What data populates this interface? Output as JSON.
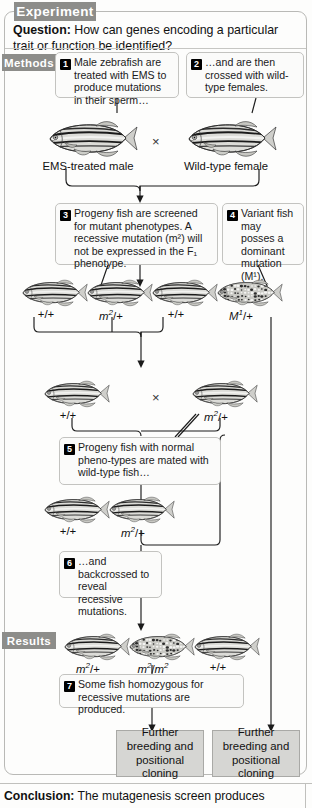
{
  "figure": {
    "section_experiment": "Experiment",
    "section_methods": "Methods",
    "section_results": "Results",
    "question_label": "Question:",
    "question_text": "How can genes encoding a particular trait or function be identified?",
    "conclusion_label": "Conclusion:",
    "conclusion_text": "The mutagenesis screen produces"
  },
  "steps": [
    {
      "number": "1",
      "text": "Male zebrafish are treated with EMS to produce mutations in their sperm…"
    },
    {
      "number": "2",
      "text": "…and are then crossed with wild-type females."
    },
    {
      "number": "3",
      "text": "Progeny fish are screened for mutant phenotypes. A recessive mutation (m²) will not be expressed in the F₁ phenotype."
    },
    {
      "number": "4",
      "text": "Variant fish may posses a dominant mutation (M¹)."
    },
    {
      "number": "5",
      "text": "Progeny fish with normal pheno-types are mated with wild-type fish…"
    },
    {
      "number": "6",
      "text": "…and backcrossed to reveal recessive mutations."
    },
    {
      "number": "7",
      "text": "Some fish homozygous for recessive mutations are produced."
    }
  ],
  "parents": {
    "male_caption": "EMS-treated male",
    "female_caption": "Wild-type female",
    "cross_symbol": "×"
  },
  "f1_generation": {
    "genotypes": [
      "+/+",
      "m2/+",
      "+/+",
      "M1/+"
    ],
    "genotype_html": [
      "+/+",
      "m²/+",
      "+/+",
      "M¹/+"
    ],
    "patterns": [
      "striped",
      "striped",
      "striped",
      "spotted"
    ]
  },
  "cross2": {
    "left_genotype": "+/+",
    "right_genotype": "m²/+",
    "cross_symbol": "×"
  },
  "cross3": {
    "left_genotype": "+/+",
    "right_genotype": "m²/+"
  },
  "results_row": {
    "genotypes": [
      "m²/+",
      "m²/m²",
      "+/+"
    ],
    "patterns": [
      "striped",
      "spotted",
      "striped"
    ]
  },
  "outcome_boxes": [
    {
      "text": "Further breeding and positional cloning"
    },
    {
      "text": "Further breeding and positional cloning"
    }
  ],
  "colors": {
    "tab_gray": "#8d8d8a",
    "box_gray": "#d6d6d3",
    "border": "#c3c3c0",
    "badge": "#000000",
    "background": "#fdfdfc"
  }
}
